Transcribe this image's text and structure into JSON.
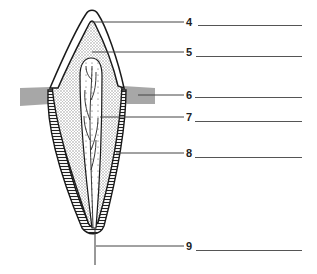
{
  "diagram": {
    "labels": [
      {
        "number": "4",
        "answer": ""
      },
      {
        "number": "5",
        "answer": ""
      },
      {
        "number": "6",
        "answer": ""
      },
      {
        "number": "7",
        "answer": ""
      },
      {
        "number": "8",
        "answer": ""
      },
      {
        "number": "9",
        "answer": ""
      }
    ]
  },
  "colors": {
    "outline": "#1a1a1a",
    "stipple": "#bdbdbd",
    "gum": "#9a9a9a",
    "leader": "#444444"
  }
}
